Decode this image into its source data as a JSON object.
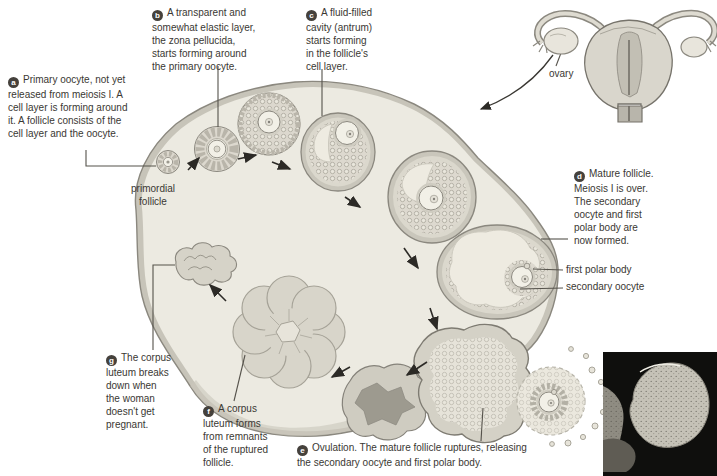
{
  "figure": {
    "callouts": [
      {
        "id": "a",
        "badge": "a",
        "text": "Primary oocyte, not yet\nreleased from meiosis I. A\ncell layer is forming around\nit. A follicle consists of the\ncell layer and the oocyte."
      },
      {
        "id": "b",
        "badge": "b",
        "text": "A transparent and\nsomewhat elastic layer,\nthe zona pellucida,\nstarts forming around\nthe primary oocyte."
      },
      {
        "id": "c",
        "badge": "c",
        "text": "A fluid-filled\ncavity (antrum)\nstarts forming\nin the follicle's\ncell layer."
      },
      {
        "id": "d",
        "badge": "d",
        "text": "Mature follicle.\nMeiosis I is over.\nThe secondary\noocyte and first\npolar body are\nnow formed."
      },
      {
        "id": "e",
        "badge": "e",
        "text": "Ovulation. The mature follicle ruptures, releasing\nthe secondary oocyte and first polar body."
      },
      {
        "id": "f",
        "badge": "f",
        "text": "A corpus\nluteum forms\nfrom remnants\nof the ruptured\nfollicle."
      },
      {
        "id": "g",
        "badge": "g",
        "text": "The corpus\nluteum breaks\ndown when\nthe woman\ndoesn't get\npregnant."
      }
    ],
    "labels": {
      "primordial_follicle": "primordial\nfollicle",
      "ovary": "ovary",
      "first_polar_body": "first polar body",
      "secondary_oocyte": "secondary oocyte"
    },
    "colors": {
      "badge": "#45413c",
      "text": "#3a3833",
      "ovary_fill": "#eceae1",
      "ovary_rim": "#c7c4b9",
      "outline": "#8b887f",
      "line": "#55524b",
      "photo_bg": "#0f0f0d"
    }
  }
}
